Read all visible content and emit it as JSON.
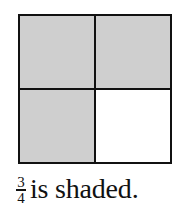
{
  "figure": {
    "grid": {
      "rows": 2,
      "columns": 2,
      "cells": [
        {
          "row": 1,
          "column": 1,
          "shaded": true
        },
        {
          "row": 1,
          "column": 2,
          "shaded": true
        },
        {
          "row": 2,
          "column": 1,
          "shaded": true
        },
        {
          "row": 2,
          "column": 2,
          "shaded": false
        }
      ],
      "shaded_color": "#cfcfcf",
      "unshaded_color": "#ffffff",
      "border_color": "#111111"
    },
    "caption": {
      "fraction": {
        "numerator": "3",
        "denominator": "4"
      },
      "text": "is shaded."
    }
  }
}
